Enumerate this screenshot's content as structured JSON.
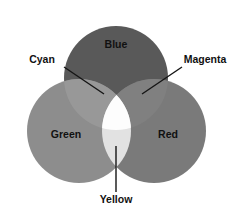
{
  "figure": {
    "background_color": "#ffffff"
  },
  "chart_data": {
    "type": "venn",
    "title": "",
    "sets": [
      {
        "name": "Blue",
        "label": "Blue",
        "cx": 116,
        "cy": 78,
        "r": 52,
        "fill": "#595959",
        "label_x": 116,
        "label_y": 48
      },
      {
        "name": "Green",
        "label": "Green",
        "cx": 79,
        "cy": 131,
        "r": 52,
        "fill": "#8d8d8d",
        "label_x": 66,
        "label_y": 138
      },
      {
        "name": "Red",
        "label": "Red",
        "cx": 154,
        "cy": 131,
        "r": 52,
        "fill": "#7a7a7a",
        "label_x": 168,
        "label_y": 138
      }
    ],
    "intersections": [
      {
        "name": "Cyan",
        "label": "Cyan",
        "of": [
          "Blue",
          "Green"
        ],
        "fill": "#989898",
        "label_x": 42,
        "label_y": 63,
        "leader": {
          "x1": 64,
          "y1": 67,
          "x2": 104,
          "y2": 94
        }
      },
      {
        "name": "Magenta",
        "label": "Magenta",
        "of": [
          "Blue",
          "Red"
        ],
        "fill": "#808080",
        "label_x": 205,
        "label_y": 63,
        "leader": {
          "x1": 182,
          "y1": 67,
          "x2": 142,
          "y2": 94
        }
      },
      {
        "name": "Yellow",
        "label": "Yellow",
        "of": [
          "Green",
          "Red"
        ],
        "fill": "#e2e2e2",
        "label_x": 116,
        "label_y": 203,
        "leader": {
          "x1": 116,
          "y1": 192,
          "x2": 116,
          "y2": 146
        }
      },
      {
        "name": "White",
        "label": "",
        "of": [
          "Blue",
          "Green",
          "Red"
        ],
        "fill": "#fdfdfd",
        "label_x": 0,
        "label_y": 0
      }
    ],
    "legend": "none",
    "grid": false
  }
}
